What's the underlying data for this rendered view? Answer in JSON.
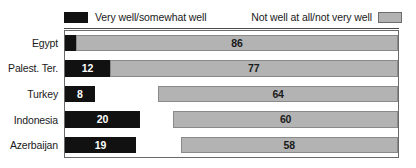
{
  "legend": {
    "left": {
      "label": "Very well/somewhat well",
      "swatch": "dark",
      "color": "#111111"
    },
    "right": {
      "label": "Not well at all/not very well",
      "swatch": "light",
      "color": "#b3b3b3"
    }
  },
  "chart_data": {
    "type": "bar",
    "orientation": "horizontal",
    "title": "",
    "xlabel": "",
    "ylabel": "",
    "xlim": [
      0,
      100
    ],
    "grid": false,
    "legend_position": "top",
    "categories": [
      "Egypt",
      "Palest. Ter.",
      "Turkey",
      "Indonesia",
      "Azerbaijan"
    ],
    "series": [
      {
        "name": "Very well/somewhat well",
        "color": "#111111",
        "align": "left",
        "values": [
          16,
          12,
          8,
          20,
          19
        ]
      },
      {
        "name": "Not well at all/not very well",
        "color": "#b3b3b3",
        "align": "right",
        "values": [
          86,
          77,
          64,
          60,
          58
        ]
      }
    ]
  }
}
